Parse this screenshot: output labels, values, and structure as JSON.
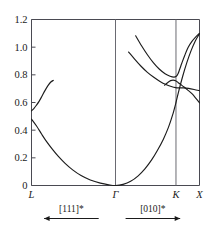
{
  "chart_data": {
    "type": "line",
    "title": "",
    "xlabel": "",
    "ylabel": "",
    "ylim": [
      0,
      1.2
    ],
    "grid": false,
    "legend": null,
    "xtick_labels": [
      "L",
      "Γ",
      "K",
      "X"
    ],
    "xtick_positions": [
      0.0,
      0.5,
      0.86,
      1.0
    ],
    "ytick_labels": [
      "0",
      "0.2",
      "0.4",
      "0.6",
      "0.8",
      "1.0",
      "1.2"
    ],
    "ytick_values": [
      0,
      0.2,
      0.4,
      0.6,
      0.8,
      1.0,
      1.2
    ],
    "vertical_lines_at": [
      "Γ",
      "K"
    ],
    "series": [
      {
        "name": "acoustic-branch",
        "points": [
          [
            0.0,
            0.48
          ],
          [
            0.03,
            0.43
          ],
          [
            0.06,
            0.372
          ],
          [
            0.09,
            0.317
          ],
          [
            0.125,
            0.261
          ],
          [
            0.16,
            0.21
          ],
          [
            0.2,
            0.16
          ],
          [
            0.245,
            0.113
          ],
          [
            0.295,
            0.072
          ],
          [
            0.35,
            0.04
          ],
          [
            0.41,
            0.017
          ],
          [
            0.46,
            0.005
          ],
          [
            0.5,
            0.0
          ],
          [
            0.545,
            0.008
          ],
          [
            0.59,
            0.03
          ],
          [
            0.635,
            0.07
          ],
          [
            0.675,
            0.12
          ],
          [
            0.715,
            0.185
          ],
          [
            0.75,
            0.255
          ],
          [
            0.785,
            0.335
          ],
          [
            0.815,
            0.42
          ],
          [
            0.84,
            0.51
          ],
          [
            0.86,
            0.6
          ],
          [
            0.878,
            0.69
          ],
          [
            0.9,
            0.79
          ],
          [
            0.925,
            0.89
          ],
          [
            0.95,
            0.975
          ],
          [
            0.975,
            1.045
          ],
          [
            1.0,
            1.098
          ]
        ]
      },
      {
        "name": "left-optic-branch",
        "points": [
          [
            0.0,
            0.54
          ],
          [
            0.014,
            0.556
          ],
          [
            0.028,
            0.578
          ],
          [
            0.045,
            0.608
          ],
          [
            0.062,
            0.645
          ],
          [
            0.08,
            0.686
          ],
          [
            0.098,
            0.722
          ],
          [
            0.115,
            0.748
          ],
          [
            0.13,
            0.76
          ]
        ]
      },
      {
        "name": "right-upper-branch",
        "points": [
          [
            0.62,
            1.082
          ],
          [
            0.655,
            1.01
          ],
          [
            0.69,
            0.945
          ],
          [
            0.725,
            0.888
          ],
          [
            0.76,
            0.842
          ],
          [
            0.795,
            0.808
          ],
          [
            0.825,
            0.79
          ],
          [
            0.848,
            0.784
          ],
          [
            0.862,
            0.79
          ],
          [
            0.872,
            0.808
          ],
          [
            0.882,
            0.84
          ],
          [
            0.895,
            0.885
          ],
          [
            0.912,
            0.94
          ],
          [
            0.932,
            0.998
          ],
          [
            0.955,
            1.042
          ],
          [
            0.978,
            1.075
          ],
          [
            1.0,
            1.1
          ]
        ]
      },
      {
        "name": "right-middle-branch",
        "points": [
          [
            0.578,
            0.965
          ],
          [
            0.615,
            0.912
          ],
          [
            0.652,
            0.862
          ],
          [
            0.69,
            0.818
          ],
          [
            0.728,
            0.782
          ],
          [
            0.765,
            0.752
          ],
          [
            0.8,
            0.73
          ],
          [
            0.832,
            0.716
          ],
          [
            0.858,
            0.708
          ],
          [
            0.88,
            0.706
          ],
          [
            0.905,
            0.706
          ],
          [
            0.935,
            0.702
          ],
          [
            0.968,
            0.694
          ],
          [
            1.0,
            0.685
          ]
        ]
      },
      {
        "name": "right-lower-branch",
        "points": [
          [
            0.792,
            0.725
          ],
          [
            0.812,
            0.745
          ],
          [
            0.828,
            0.758
          ],
          [
            0.843,
            0.762
          ],
          [
            0.858,
            0.757
          ],
          [
            0.872,
            0.745
          ],
          [
            0.888,
            0.73
          ],
          [
            0.908,
            0.712
          ],
          [
            0.932,
            0.688
          ],
          [
            0.958,
            0.66
          ],
          [
            0.98,
            0.628
          ],
          [
            1.0,
            0.598
          ]
        ]
      }
    ],
    "direction_annotations": [
      {
        "label": "[111]*",
        "arrow": "left",
        "x_start": 0.075,
        "x_end": 0.4
      },
      {
        "label": "[010]*",
        "arrow": "right",
        "x_start": 0.56,
        "x_end": 0.885
      }
    ]
  }
}
